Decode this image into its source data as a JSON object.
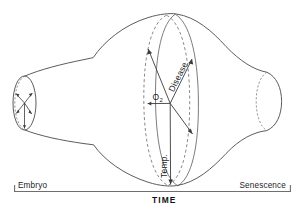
{
  "figure": {
    "title": "",
    "axis": {
      "name": "TIME",
      "start_label": "Embryo",
      "end_label": "Senescence"
    },
    "vectors": [
      {
        "id": "o2",
        "label": "O",
        "subscript": "2",
        "direction": "left",
        "name": "oxygen-vector"
      },
      {
        "id": "disease",
        "label": "Disease",
        "subscript": "",
        "direction": "upper-right",
        "name": "disease-vector"
      },
      {
        "id": "temp",
        "label": "Temp.",
        "subscript": "",
        "direction": "down",
        "name": "temperature-vector"
      }
    ],
    "colors": {
      "stroke": "#4a4a4a",
      "dashed": "#6b6b6b",
      "vector": "#3c3c3c",
      "axis": "#6f6f6f",
      "text": "#1d1d1d",
      "background": "#ffffff"
    }
  }
}
